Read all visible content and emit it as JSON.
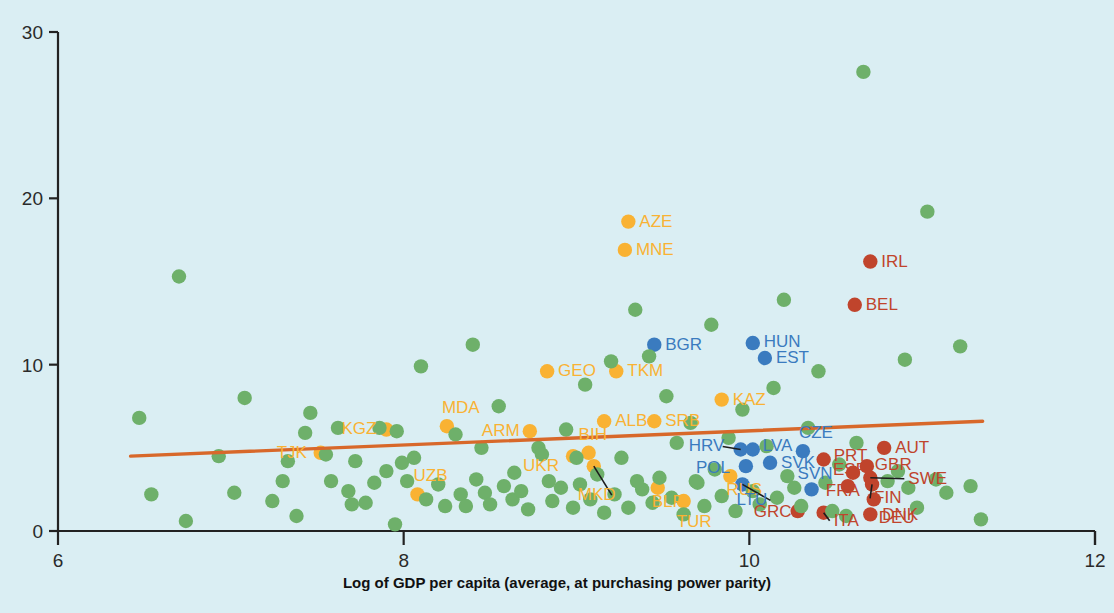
{
  "chart_data": {
    "type": "scatter",
    "title": "",
    "xlabel": "Log of GDP per capita (average, at purchasing power parity)",
    "ylabel": "",
    "xlim": [
      6,
      12
    ],
    "ylim": [
      0,
      30
    ],
    "xticks": [
      "6",
      "8",
      "10",
      "12"
    ],
    "xtick_values": [
      6,
      8,
      10,
      12
    ],
    "yticks": [
      "0",
      "10",
      "20",
      "30"
    ],
    "ytick_values": [
      0,
      10,
      20,
      30
    ],
    "grid": false,
    "legend_position": "none",
    "colors": {
      "green": "#6eb06a",
      "orange": "#f9b233",
      "blue": "#3a7bbf",
      "red": "#c0442c",
      "trendline": "#d8682a",
      "background": "#daeef3",
      "axis": "#222222"
    },
    "trendline": {
      "type": "linear",
      "x_start": 6.42,
      "y_start": 4.5,
      "x_end": 11.35,
      "y_end": 6.6
    },
    "series": [
      {
        "name": "Caucasus and Central Asia",
        "color": "#f9b233",
        "points": [
          {
            "label": "TJK",
            "x": 7.52,
            "y": 4.7,
            "label_dx": -44,
            "label_dy": 5
          },
          {
            "label": "KGZ",
            "x": 7.9,
            "y": 6.1,
            "label_dx": -45,
            "label_dy": 4
          },
          {
            "label": "MDA",
            "x": 8.25,
            "y": 6.3,
            "label_dx": -5,
            "label_dy": -13
          },
          {
            "label": "ARM",
            "x": 8.73,
            "y": 6.0,
            "label_dx": -48,
            "label_dy": 5
          },
          {
            "label": "UZB",
            "x": 8.08,
            "y": 2.2,
            "label_dx": -4,
            "label_dy": -13
          },
          {
            "label": "UKR",
            "x": 8.98,
            "y": 4.5,
            "label_dx": -50,
            "label_dy": 15
          },
          {
            "label": "GEO",
            "x": 8.83,
            "y": 9.6,
            "label_dx": 11,
            "label_dy": 5
          },
          {
            "label": "TKM",
            "x": 9.23,
            "y": 9.6,
            "label_dx": 11,
            "label_dy": 5
          },
          {
            "label": "AZE",
            "x": 9.3,
            "y": 18.6,
            "label_dx": 11,
            "label_dy": 5
          },
          {
            "label": "MNE",
            "x": 9.28,
            "y": 16.9,
            "label_dx": 11,
            "label_dy": 5
          },
          {
            "label": "ALB",
            "x": 9.16,
            "y": 6.6,
            "label_dx": 11,
            "label_dy": 5
          },
          {
            "label": "SRB",
            "x": 9.45,
            "y": 6.6,
            "label_dx": 11,
            "label_dy": 5
          },
          {
            "label": "KAZ",
            "x": 9.84,
            "y": 7.9,
            "label_dx": 11,
            "label_dy": 5
          },
          {
            "label": "BIH",
            "x": 9.07,
            "y": 4.7,
            "label_dx": -10,
            "label_dy": -13
          },
          {
            "label": "MKD",
            "x": 9.1,
            "y": 3.9,
            "label_dx": -16,
            "label_dy": 34,
            "leader": true
          },
          {
            "label": "BLR",
            "x": 9.47,
            "y": 2.6,
            "label_dx": -6,
            "label_dy": 19
          },
          {
            "label": "TUR",
            "x": 9.62,
            "y": 1.8,
            "label_dx": -7,
            "label_dy": 26
          },
          {
            "label": "RUS",
            "x": 9.89,
            "y": 3.3,
            "label_dx": -4,
            "label_dy": 19
          }
        ]
      },
      {
        "name": "Emerging Europe",
        "color": "#3a7bbf",
        "points": [
          {
            "label": "BGR",
            "x": 9.45,
            "y": 11.2,
            "label_dx": 11,
            "label_dy": 5
          },
          {
            "label": "HUN",
            "x": 10.02,
            "y": 11.3,
            "label_dx": 11,
            "label_dy": 4
          },
          {
            "label": "EST",
            "x": 10.09,
            "y": 10.4,
            "label_dx": 11,
            "label_dy": 5
          },
          {
            "label": "HRV",
            "x": 9.95,
            "y": 4.9,
            "label_dx": -52,
            "label_dy": 2,
            "leader": true
          },
          {
            "label": "LVA",
            "x": 10.02,
            "y": 4.9,
            "label_dx": 10,
            "label_dy": 2
          },
          {
            "label": "POL",
            "x": 9.98,
            "y": 3.9,
            "label_dx": -50,
            "label_dy": 7
          },
          {
            "label": "SVK",
            "x": 10.12,
            "y": 4.1,
            "label_dx": 11,
            "label_dy": 5
          },
          {
            "label": "LTU",
            "x": 9.96,
            "y": 2.8,
            "label_dx": -6,
            "label_dy": 21,
            "leader": true
          },
          {
            "label": "SVN",
            "x": 10.36,
            "y": 2.5,
            "label_dx": -14,
            "label_dy": -10
          },
          {
            "label": "CZE",
            "x": 10.31,
            "y": 4.8,
            "label_dx": -4,
            "label_dy": -13
          }
        ]
      },
      {
        "name": "Advanced Europe",
        "color": "#c0442c",
        "points": [
          {
            "label": "IRL",
            "x": 10.7,
            "y": 16.2,
            "label_dx": 11,
            "label_dy": 5
          },
          {
            "label": "BEL",
            "x": 10.61,
            "y": 13.6,
            "label_dx": 11,
            "label_dy": 5
          },
          {
            "label": "AUT",
            "x": 10.78,
            "y": 5.0,
            "label_dx": 11,
            "label_dy": 5
          },
          {
            "label": "GBR",
            "x": 10.68,
            "y": 3.9,
            "label_dx": 8,
            "label_dy": 4
          },
          {
            "label": "PRT",
            "x": 10.43,
            "y": 4.3,
            "label_dx": 10,
            "label_dy": 2
          },
          {
            "label": "ESP",
            "x": 10.6,
            "y": 3.5,
            "label_dx": -20,
            "label_dy": 2
          },
          {
            "label": "SWE",
            "x": 10.7,
            "y": 3.2,
            "label_dx": 38,
            "label_dy": 6,
            "leader": true
          },
          {
            "label": "FRA",
            "x": 10.57,
            "y": 2.7,
            "label_dx": -22,
            "label_dy": 10
          },
          {
            "label": "FIN",
            "x": 10.71,
            "y": 2.8,
            "label_dx": 2,
            "label_dy": 19,
            "leader": true
          },
          {
            "label": "DEU",
            "x": 10.72,
            "y": 1.9,
            "label_dx": 5,
            "label_dy": 24
          },
          {
            "label": "DNK",
            "x": 10.7,
            "y": 1.0,
            "label_dx": 12,
            "label_dy": 6
          },
          {
            "label": "ITA",
            "x": 10.43,
            "y": 1.1,
            "label_dx": 10,
            "label_dy": 13,
            "leader": true
          },
          {
            "label": "GRC",
            "x": 10.28,
            "y": 1.2,
            "label_dx": -44,
            "label_dy": 6
          }
        ]
      },
      {
        "name": "Rest of the world",
        "color": "#6eb06a",
        "points": [
          {
            "x": 6.47,
            "y": 6.8
          },
          {
            "x": 6.7,
            "y": 15.3
          },
          {
            "x": 6.54,
            "y": 2.2
          },
          {
            "x": 6.74,
            "y": 0.6
          },
          {
            "x": 6.93,
            "y": 4.5
          },
          {
            "x": 7.08,
            "y": 8.0
          },
          {
            "x": 7.02,
            "y": 2.3
          },
          {
            "x": 7.24,
            "y": 1.8
          },
          {
            "x": 7.33,
            "y": 4.2
          },
          {
            "x": 7.3,
            "y": 3.0
          },
          {
            "x": 7.43,
            "y": 5.9
          },
          {
            "x": 7.46,
            "y": 7.1
          },
          {
            "x": 7.38,
            "y": 0.9
          },
          {
            "x": 7.55,
            "y": 4.6
          },
          {
            "x": 7.62,
            "y": 6.2
          },
          {
            "x": 7.58,
            "y": 3.0
          },
          {
            "x": 7.68,
            "y": 2.4
          },
          {
            "x": 7.7,
            "y": 1.6
          },
          {
            "x": 7.78,
            "y": 1.7
          },
          {
            "x": 7.83,
            "y": 2.9
          },
          {
            "x": 7.86,
            "y": 6.2
          },
          {
            "x": 7.96,
            "y": 6.0
          },
          {
            "x": 7.99,
            "y": 4.1
          },
          {
            "x": 7.95,
            "y": 0.4
          },
          {
            "x": 8.02,
            "y": 3.0
          },
          {
            "x": 8.1,
            "y": 9.9
          },
          {
            "x": 8.13,
            "y": 1.9
          },
          {
            "x": 8.2,
            "y": 2.8
          },
          {
            "x": 8.24,
            "y": 1.5
          },
          {
            "x": 8.3,
            "y": 5.8
          },
          {
            "x": 8.33,
            "y": 2.2
          },
          {
            "x": 8.36,
            "y": 1.5
          },
          {
            "x": 8.4,
            "y": 11.2
          },
          {
            "x": 8.42,
            "y": 3.1
          },
          {
            "x": 8.47,
            "y": 2.3
          },
          {
            "x": 8.5,
            "y": 1.6
          },
          {
            "x": 8.55,
            "y": 7.5
          },
          {
            "x": 8.58,
            "y": 2.7
          },
          {
            "x": 8.63,
            "y": 1.9
          },
          {
            "x": 8.68,
            "y": 2.4
          },
          {
            "x": 8.72,
            "y": 1.3
          },
          {
            "x": 8.78,
            "y": 5.0
          },
          {
            "x": 8.84,
            "y": 3.0
          },
          {
            "x": 8.86,
            "y": 1.8
          },
          {
            "x": 8.91,
            "y": 2.6
          },
          {
            "x": 8.94,
            "y": 6.1
          },
          {
            "x": 8.98,
            "y": 1.4
          },
          {
            "x": 9.02,
            "y": 2.8
          },
          {
            "x": 9.05,
            "y": 8.8
          },
          {
            "x": 9.08,
            "y": 1.9
          },
          {
            "x": 9.12,
            "y": 3.4
          },
          {
            "x": 9.16,
            "y": 1.1
          },
          {
            "x": 9.2,
            "y": 10.2
          },
          {
            "x": 9.22,
            "y": 2.2
          },
          {
            "x": 9.26,
            "y": 4.4
          },
          {
            "x": 9.3,
            "y": 1.4
          },
          {
            "x": 9.34,
            "y": 13.3
          },
          {
            "x": 9.38,
            "y": 2.5
          },
          {
            "x": 9.42,
            "y": 10.5
          },
          {
            "x": 9.44,
            "y": 1.7
          },
          {
            "x": 9.48,
            "y": 3.2
          },
          {
            "x": 9.52,
            "y": 8.1
          },
          {
            "x": 9.55,
            "y": 2.0
          },
          {
            "x": 9.58,
            "y": 5.3
          },
          {
            "x": 9.62,
            "y": 1.0
          },
          {
            "x": 9.66,
            "y": 6.5
          },
          {
            "x": 9.7,
            "y": 2.9
          },
          {
            "x": 9.74,
            "y": 1.5
          },
          {
            "x": 9.78,
            "y": 12.4
          },
          {
            "x": 9.8,
            "y": 3.7
          },
          {
            "x": 9.84,
            "y": 2.1
          },
          {
            "x": 9.88,
            "y": 5.6
          },
          {
            "x": 9.92,
            "y": 1.2
          },
          {
            "x": 9.96,
            "y": 7.3
          },
          {
            "x": 10.02,
            "y": 2.4
          },
          {
            "x": 10.06,
            "y": 1.6
          },
          {
            "x": 10.1,
            "y": 5.1
          },
          {
            "x": 10.14,
            "y": 8.6
          },
          {
            "x": 10.16,
            "y": 2.0
          },
          {
            "x": 10.2,
            "y": 13.9
          },
          {
            "x": 10.22,
            "y": 3.3
          },
          {
            "x": 10.26,
            "y": 2.6
          },
          {
            "x": 10.3,
            "y": 1.5
          },
          {
            "x": 10.34,
            "y": 6.2
          },
          {
            "x": 10.4,
            "y": 9.6
          },
          {
            "x": 10.44,
            "y": 2.9
          },
          {
            "x": 10.48,
            "y": 1.2
          },
          {
            "x": 10.52,
            "y": 4.0
          },
          {
            "x": 10.56,
            "y": 0.9
          },
          {
            "x": 10.62,
            "y": 5.3
          },
          {
            "x": 10.66,
            "y": 27.6
          },
          {
            "x": 10.8,
            "y": 3.0
          },
          {
            "x": 10.86,
            "y": 3.6
          },
          {
            "x": 10.92,
            "y": 2.6
          },
          {
            "x": 10.97,
            "y": 1.4
          },
          {
            "x": 11.03,
            "y": 19.2
          },
          {
            "x": 11.08,
            "y": 3.1
          },
          {
            "x": 11.14,
            "y": 2.3
          },
          {
            "x": 11.22,
            "y": 11.1
          },
          {
            "x": 11.28,
            "y": 2.7
          },
          {
            "x": 11.34,
            "y": 0.7
          },
          {
            "x": 10.9,
            "y": 10.3
          },
          {
            "x": 8.8,
            "y": 4.6
          },
          {
            "x": 8.06,
            "y": 4.4
          },
          {
            "x": 7.72,
            "y": 4.2
          },
          {
            "x": 9.0,
            "y": 4.4
          },
          {
            "x": 7.9,
            "y": 3.6
          },
          {
            "x": 8.64,
            "y": 3.5
          },
          {
            "x": 9.35,
            "y": 3.0
          },
          {
            "x": 9.69,
            "y": 3.0
          },
          {
            "x": 8.45,
            "y": 5.0
          }
        ]
      }
    ]
  }
}
